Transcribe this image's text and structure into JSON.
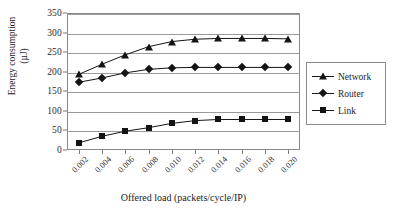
{
  "chart_data": {
    "type": "line",
    "title": "",
    "xlabel": "Offered load (packets/cycle/IP)",
    "ylabel": "Energy consumption (µJ)",
    "ylabel_line1": "Energy consumption",
    "ylabel_line2": "(µJ)",
    "x": [
      0.002,
      0.004,
      0.006,
      0.008,
      0.01,
      0.012,
      0.014,
      0.016,
      0.018,
      0.02
    ],
    "xtick_labels": [
      "0.002",
      "0.004",
      "0.006",
      "0.008",
      "0.010",
      "0.012",
      "0.014",
      "0.016",
      "0.018",
      "0.020"
    ],
    "ytick_labels": [
      "0",
      "50",
      "100",
      "150",
      "200",
      "250",
      "300",
      "350"
    ],
    "yticks": [
      0,
      50,
      100,
      150,
      200,
      250,
      300,
      350
    ],
    "ylim": [
      0,
      350
    ],
    "xlim": [
      0.001,
      0.021
    ],
    "grid": "horizontal",
    "legend_position": "right-outside",
    "series": [
      {
        "name": "Network",
        "marker": "triangle",
        "color": "#141414",
        "values": [
          193,
          219,
          243,
          264,
          277,
          283,
          285,
          285,
          285,
          284
        ]
      },
      {
        "name": "Router",
        "marker": "diamond",
        "color": "#141414",
        "values": [
          173,
          184,
          197,
          206,
          210,
          211,
          211,
          211,
          211,
          211
        ]
      },
      {
        "name": "Link",
        "marker": "square",
        "color": "#141414",
        "values": [
          18,
          35,
          48,
          57,
          68,
          75,
          78,
          78,
          78,
          78
        ]
      }
    ]
  },
  "legend": {
    "items": [
      {
        "label": "Network",
        "marker": "triangle"
      },
      {
        "label": "Router",
        "marker": "diamond"
      },
      {
        "label": "Link",
        "marker": "square"
      }
    ]
  }
}
